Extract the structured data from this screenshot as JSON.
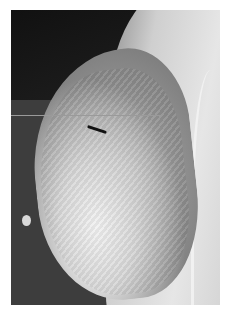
{
  "image": {
    "subject": "mammogram-mediolateral-oblique-view",
    "colors": {
      "background": "#ffffff",
      "dark_region": "#1c1c1c",
      "tissue_bright": "#f2f2f2",
      "tissue_mid": "#8e8e8e",
      "pectoral": "#e6e6e6"
    }
  }
}
